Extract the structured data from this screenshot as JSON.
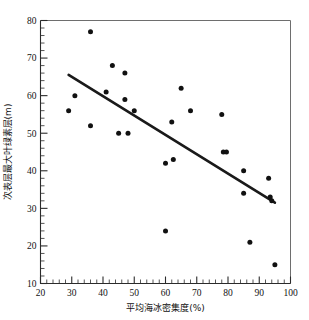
{
  "chart_data": {
    "type": "scatter",
    "title": "",
    "xlabel": "平均海冰密集度(%)",
    "ylabel": "次表层最大叶绿素层(m)",
    "xlim": [
      20,
      100
    ],
    "ylim": [
      10,
      80
    ],
    "xticks": [
      20,
      30,
      40,
      50,
      60,
      70,
      80,
      90,
      100
    ],
    "xtick_labels": [
      "20",
      "30",
      "40",
      "50",
      "60",
      "70",
      "80",
      "90",
      "100"
    ],
    "yticks": [
      10,
      20,
      30,
      40,
      50,
      60,
      70,
      80
    ],
    "ytick_labels": [
      "10",
      "20",
      "30",
      "40",
      "50",
      "60",
      "70",
      "80"
    ],
    "x_minor_tick_step": 2,
    "y_minor_tick_step": 2,
    "grid": false,
    "legend": null,
    "marker": "filled-circle",
    "marker_color": "#111111",
    "points": [
      {
        "x": 29.0,
        "y": 56.0
      },
      {
        "x": 31.0,
        "y": 60.0
      },
      {
        "x": 36.0,
        "y": 77.0
      },
      {
        "x": 36.0,
        "y": 52.0
      },
      {
        "x": 41.0,
        "y": 61.0
      },
      {
        "x": 43.0,
        "y": 68.0
      },
      {
        "x": 45.0,
        "y": 50.0
      },
      {
        "x": 47.0,
        "y": 66.0
      },
      {
        "x": 47.0,
        "y": 59.0
      },
      {
        "x": 48.0,
        "y": 50.0
      },
      {
        "x": 50.0,
        "y": 56.0
      },
      {
        "x": 60.0,
        "y": 42.0
      },
      {
        "x": 60.0,
        "y": 24.0
      },
      {
        "x": 62.0,
        "y": 53.0
      },
      {
        "x": 62.5,
        "y": 43.0
      },
      {
        "x": 65.0,
        "y": 62.0
      },
      {
        "x": 68.0,
        "y": 56.0
      },
      {
        "x": 78.0,
        "y": 55.0
      },
      {
        "x": 78.5,
        "y": 45.0
      },
      {
        "x": 79.5,
        "y": 45.0
      },
      {
        "x": 85.0,
        "y": 40.0
      },
      {
        "x": 85.0,
        "y": 34.0
      },
      {
        "x": 87.0,
        "y": 21.0
      },
      {
        "x": 93.0,
        "y": 38.0
      },
      {
        "x": 93.5,
        "y": 33.0
      },
      {
        "x": 94.0,
        "y": 32.0
      },
      {
        "x": 95.0,
        "y": 15.0
      }
    ],
    "trendline": {
      "type": "linear",
      "x_start": 29.0,
      "y_start": 65.5,
      "x_end": 95.0,
      "y_end": 31.5,
      "color": "#1a1a1a"
    }
  }
}
